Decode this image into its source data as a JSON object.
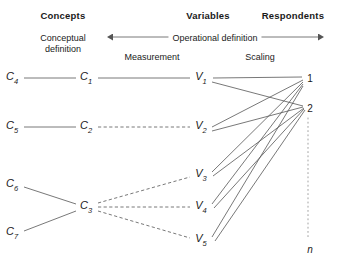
{
  "headers": [
    {
      "label": "Concepts",
      "x": 63,
      "y": 10
    },
    {
      "label": "Variables",
      "x": 208,
      "y": 10
    },
    {
      "label": "Respondents",
      "x": 293,
      "y": 10
    }
  ],
  "sublabels": [
    {
      "label": "Conceptual definition",
      "line1": "Conceptual",
      "line2": "definition",
      "x": 63,
      "y": 33
    },
    {
      "label": "Operational definition",
      "x": 215,
      "y": 33
    },
    {
      "label": "Measurement",
      "x": 152,
      "y": 52
    },
    {
      "label": "Scaling",
      "x": 260,
      "y": 52
    }
  ],
  "arrow": {
    "x1": 113,
    "x2": 318,
    "y": 37,
    "label": "Operational definition"
  },
  "concepts": [
    {
      "id": "C4",
      "base": "C",
      "sub": "4",
      "x": 12,
      "y": 78
    },
    {
      "id": "C1",
      "base": "C",
      "sub": "1",
      "x": 86,
      "y": 78
    },
    {
      "id": "C5",
      "base": "C",
      "sub": "5",
      "x": 12,
      "y": 127
    },
    {
      "id": "C2",
      "base": "C",
      "sub": "2",
      "x": 86,
      "y": 127
    },
    {
      "id": "C6",
      "base": "C",
      "sub": "6",
      "x": 12,
      "y": 185
    },
    {
      "id": "C3",
      "base": "C",
      "sub": "3",
      "x": 86,
      "y": 207
    },
    {
      "id": "C7",
      "base": "C",
      "sub": "7",
      "x": 12,
      "y": 233
    }
  ],
  "variables": [
    {
      "id": "V1",
      "base": "V",
      "sub": "1",
      "x": 201,
      "y": 78
    },
    {
      "id": "V2",
      "base": "V",
      "sub": "2",
      "x": 201,
      "y": 127
    },
    {
      "id": "V3",
      "base": "V",
      "sub": "3",
      "x": 201,
      "y": 175
    },
    {
      "id": "V4",
      "base": "V",
      "sub": "4",
      "x": 201,
      "y": 207
    },
    {
      "id": "V5",
      "base": "V",
      "sub": "5",
      "x": 201,
      "y": 240
    }
  ],
  "respondents": [
    {
      "id": "R1",
      "label": "1",
      "x": 310,
      "y": 78,
      "italic": false
    },
    {
      "id": "R2",
      "label": "2",
      "x": 310,
      "y": 108,
      "italic": false
    },
    {
      "id": "Rn",
      "label": "n",
      "x": 310,
      "y": 249,
      "italic": true
    }
  ],
  "dotted_column": {
    "x": 308,
    "y1": 118,
    "y2": 238
  },
  "links": {
    "concept_solid": [
      {
        "from": "C4",
        "to": "C1",
        "x1": 24,
        "y1": 78,
        "x2": 76,
        "y2": 78
      },
      {
        "from": "C5",
        "to": "C2",
        "x1": 24,
        "y1": 127,
        "x2": 76,
        "y2": 127
      },
      {
        "from": "C6",
        "to": "C3",
        "x1": 24,
        "y1": 187,
        "x2": 76,
        "y2": 204
      },
      {
        "from": "C7",
        "to": "C3",
        "x1": 24,
        "y1": 231,
        "x2": 76,
        "y2": 211
      }
    ],
    "concept_to_variable": [
      {
        "from": "C1",
        "to": "V1",
        "style": "solid",
        "x1": 98,
        "y1": 78,
        "x2": 190,
        "y2": 78
      },
      {
        "from": "C2",
        "to": "V2",
        "style": "dashed",
        "x1": 98,
        "y1": 127,
        "x2": 190,
        "y2": 127
      },
      {
        "from": "C3",
        "to": "V3",
        "style": "dashed",
        "x1": 98,
        "y1": 203,
        "x2": 190,
        "y2": 177
      },
      {
        "from": "C3",
        "to": "V4",
        "style": "dashed",
        "x1": 98,
        "y1": 207,
        "x2": 190,
        "y2": 207
      },
      {
        "from": "C3",
        "to": "V5",
        "style": "dashed",
        "x1": 98,
        "y1": 211,
        "x2": 190,
        "y2": 238
      }
    ],
    "variable_to_respondent": [
      {
        "from": "V1",
        "to": "R1",
        "x1": 213,
        "y1": 78,
        "x2": 302,
        "y2": 77
      },
      {
        "from": "V1",
        "to": "R2",
        "x1": 212,
        "y1": 82,
        "x2": 303,
        "y2": 106
      },
      {
        "from": "V2",
        "to": "R1",
        "x1": 212,
        "y1": 127,
        "x2": 303,
        "y2": 80
      },
      {
        "from": "V2",
        "to": "R2",
        "x1": 212,
        "y1": 131,
        "x2": 303,
        "y2": 107
      },
      {
        "from": "V3",
        "to": "R1",
        "x1": 212,
        "y1": 172,
        "x2": 303,
        "y2": 82
      },
      {
        "from": "V3",
        "to": "R2",
        "x1": 213,
        "y1": 176,
        "x2": 304,
        "y2": 108
      },
      {
        "from": "V4",
        "to": "R1",
        "x1": 212,
        "y1": 204,
        "x2": 303,
        "y2": 84
      },
      {
        "from": "V4",
        "to": "R2",
        "x1": 214,
        "y1": 208,
        "x2": 304,
        "y2": 109
      },
      {
        "from": "V5",
        "to": "R1",
        "x1": 212,
        "y1": 237,
        "x2": 303,
        "y2": 86
      },
      {
        "from": "V5",
        "to": "R2",
        "x1": 215,
        "y1": 241,
        "x2": 305,
        "y2": 110
      }
    ]
  },
  "style": {
    "line_color": "#555555",
    "dot_color": "#999999",
    "text_color": "#1a1a1a",
    "background": "#ffffff"
  }
}
